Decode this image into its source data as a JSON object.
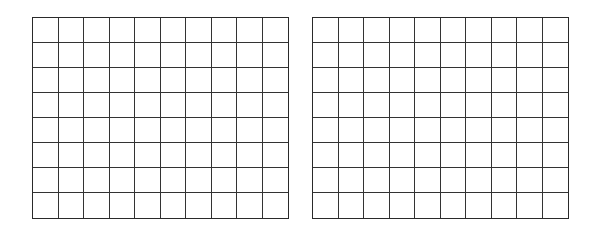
{
  "grids": [
    {
      "name": "left-grid",
      "rows": 8,
      "cols": 10,
      "x": 32,
      "y": 17,
      "width": 257,
      "height": 202
    },
    {
      "name": "right-grid",
      "rows": 8,
      "cols": 10,
      "x": 312,
      "y": 17,
      "width": 257,
      "height": 202
    }
  ],
  "line_color": "#2a2a2a",
  "background": "#ffffff"
}
